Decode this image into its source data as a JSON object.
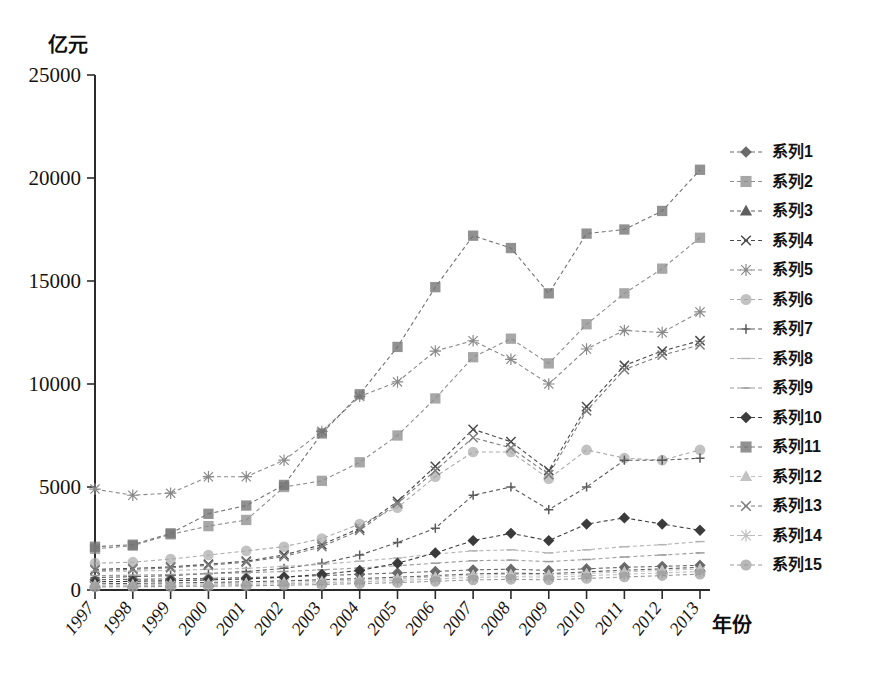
{
  "axes": {
    "y_unit_label": "亿元",
    "x_axis_title": "年份",
    "y_ticks": [
      "0",
      "5000",
      "10000",
      "15000",
      "20000",
      "25000"
    ],
    "x_ticks": [
      "1997",
      "1998",
      "1999",
      "2000",
      "2001",
      "2002",
      "2003",
      "2004",
      "2005",
      "2006",
      "2007",
      "2008",
      "2009",
      "2010",
      "2011",
      "2012",
      "2013"
    ]
  },
  "legend": {
    "items": [
      {
        "label": "系列1",
        "marker": "diamond-marker",
        "color": "#6b6b6b"
      },
      {
        "label": "系列2",
        "marker": "square-marker",
        "color": "#8f8f8f"
      },
      {
        "label": "系列3",
        "marker": "triangle-marker",
        "color": "#5e5e5e"
      },
      {
        "label": "系列4",
        "marker": "x-marker",
        "color": "#4a4a4a"
      },
      {
        "label": "系列5",
        "marker": "asterisk-marker",
        "color": "#8a8a8a"
      },
      {
        "label": "系列6",
        "marker": "circle-marker",
        "color": "#a9a9a9"
      },
      {
        "label": "系列7",
        "marker": "plus-marker",
        "color": "#5a5a5a"
      },
      {
        "label": "系列8",
        "marker": "dash-marker",
        "color": "#b4b4b4"
      },
      {
        "label": "系列9",
        "marker": "dash-marker",
        "color": "#9c9c9c"
      },
      {
        "label": "系列10",
        "marker": "diamond-marker",
        "color": "#3b3b3b"
      },
      {
        "label": "系列11",
        "marker": "square-marker",
        "color": "#737373"
      },
      {
        "label": "系列12",
        "marker": "triangle-marker",
        "color": "#c2c2c2"
      },
      {
        "label": "系列13",
        "marker": "x-marker",
        "color": "#7d7d7d"
      },
      {
        "label": "系列14",
        "marker": "asterisk-marker",
        "color": "#bdbdbd"
      },
      {
        "label": "系列15",
        "marker": "circle-marker",
        "color": "#9a9a9a"
      }
    ]
  },
  "chart_data": {
    "type": "line",
    "title": "",
    "xlabel": "年份",
    "ylabel": "亿元",
    "ylim": [
      0,
      25000
    ],
    "ytick_step": 5000,
    "grid": false,
    "legend_position": "right",
    "x": [
      "1997",
      "1998",
      "1999",
      "2000",
      "2001",
      "2002",
      "2003",
      "2004",
      "2005",
      "2006",
      "2007",
      "2008",
      "2009",
      "2010",
      "2011",
      "2012",
      "2013"
    ],
    "series": [
      {
        "name": "系列1",
        "marker": "diamond",
        "values": [
          500,
          520,
          540,
          570,
          600,
          640,
          700,
          760,
          830,
          900,
          980,
          1010,
          950,
          1030,
          1100,
          1150,
          1200
        ]
      },
      {
        "name": "系列2",
        "marker": "square",
        "values": [
          2000,
          2150,
          2700,
          3100,
          3400,
          5000,
          5300,
          6200,
          7500,
          9300,
          11300,
          12200,
          11000,
          12900,
          14400,
          15600,
          17100
        ]
      },
      {
        "name": "系列3",
        "marker": "triangle",
        "values": [
          300,
          320,
          340,
          370,
          400,
          440,
          500,
          560,
          620,
          700,
          780,
          820,
          790,
          880,
          960,
          1030,
          1100
        ]
      },
      {
        "name": "系列4",
        "marker": "x",
        "values": [
          1000,
          1050,
          1120,
          1250,
          1400,
          1700,
          2200,
          3000,
          4300,
          6000,
          7800,
          7200,
          5800,
          8900,
          10900,
          11600,
          12100
        ]
      },
      {
        "name": "系列5",
        "marker": "asterisk",
        "values": [
          4900,
          4600,
          4700,
          5500,
          5500,
          6300,
          7700,
          9400,
          10100,
          11600,
          12100,
          11200,
          10000,
          11700,
          12600,
          12500,
          13500
        ]
      },
      {
        "name": "系列6",
        "marker": "circle",
        "values": [
          1300,
          1350,
          1500,
          1700,
          1900,
          2100,
          2500,
          3200,
          4000,
          5500,
          6700,
          6700,
          5400,
          6800,
          6400,
          6300,
          6800
        ]
      },
      {
        "name": "系列7",
        "marker": "plus",
        "values": [
          600,
          650,
          700,
          800,
          900,
          1050,
          1300,
          1700,
          2300,
          3000,
          4600,
          5000,
          3900,
          5000,
          6300,
          6300,
          6400
        ]
      },
      {
        "name": "系列8",
        "marker": "dash",
        "values": [
          900,
          920,
          950,
          1000,
          1050,
          1150,
          1250,
          1400,
          1550,
          1750,
          1900,
          1950,
          1800,
          1950,
          2100,
          2200,
          2350
        ]
      },
      {
        "name": "系列9",
        "marker": "dash",
        "values": [
          700,
          720,
          750,
          790,
          840,
          900,
          980,
          1070,
          1180,
          1300,
          1420,
          1450,
          1380,
          1480,
          1600,
          1700,
          1800
        ]
      },
      {
        "name": "系列10",
        "marker": "diamond",
        "values": [
          400,
          420,
          450,
          490,
          540,
          620,
          760,
          950,
          1300,
          1800,
          2400,
          2750,
          2400,
          3200,
          3500,
          3200,
          2900
        ]
      },
      {
        "name": "系列11",
        "marker": "square",
        "values": [
          2100,
          2200,
          2750,
          3700,
          4100,
          5100,
          7600,
          9500,
          11800,
          14700,
          17200,
          16600,
          14400,
          17300,
          17500,
          18400,
          20400
        ]
      },
      {
        "name": "系列12",
        "marker": "triangle",
        "values": [
          250,
          260,
          280,
          300,
          330,
          370,
          420,
          480,
          550,
          630,
          720,
          760,
          730,
          800,
          880,
          950,
          1020
        ]
      },
      {
        "name": "系列13",
        "marker": "x",
        "values": [
          950,
          1000,
          1080,
          1200,
          1350,
          1620,
          2100,
          2900,
          4200,
          5800,
          7400,
          6900,
          5600,
          8700,
          10700,
          11400,
          11900
        ]
      },
      {
        "name": "系列14",
        "marker": "asterisk",
        "values": [
          200,
          210,
          225,
          245,
          270,
          300,
          345,
          400,
          460,
          530,
          610,
          650,
          620,
          690,
          760,
          830,
          900
        ]
      },
      {
        "name": "系列15",
        "marker": "circle",
        "values": [
          150,
          160,
          170,
          185,
          205,
          230,
          265,
          310,
          360,
          420,
          490,
          520,
          495,
          560,
          630,
          700,
          770
        ]
      }
    ]
  }
}
